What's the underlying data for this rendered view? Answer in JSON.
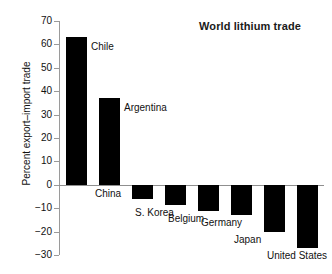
{
  "chart_data": {
    "type": "bar",
    "title": "World lithium trade",
    "xlabel": "",
    "ylabel": "Percent export–import trade",
    "ylim": [
      -30,
      70
    ],
    "ytick_step": 10,
    "grid": false,
    "legend": "none",
    "bar_color": "#000000",
    "axis_color": "#9a9a9a",
    "categories": [
      "Chile",
      "Argentina",
      "China",
      "S. Korea",
      "Belgium",
      "Germany",
      "Japan",
      "United States"
    ],
    "values": [
      63,
      37,
      -6,
      -8.5,
      -11,
      -13,
      -20,
      -27
    ],
    "ticks": [
      "70",
      "60",
      "50",
      "40",
      "30",
      "20",
      "10",
      "0",
      "−10",
      "−20",
      "−30"
    ],
    "tick_values": [
      70,
      60,
      50,
      40,
      30,
      20,
      10,
      0,
      -10,
      -20,
      -30
    ],
    "annotations": [
      {
        "text": "Chile",
        "value": 63
      },
      {
        "text": "Argentina",
        "value": 37
      },
      {
        "text": "China",
        "value": -6
      },
      {
        "text": "S. Korea",
        "value": -8.5
      },
      {
        "text": "Belgium",
        "value": -11
      },
      {
        "text": "Germany",
        "value": -13
      },
      {
        "text": "Japan",
        "value": -20
      },
      {
        "text": "United States",
        "value": -27
      }
    ]
  },
  "title": "World lithium trade",
  "y_axis_title": "Percent export–import trade"
}
